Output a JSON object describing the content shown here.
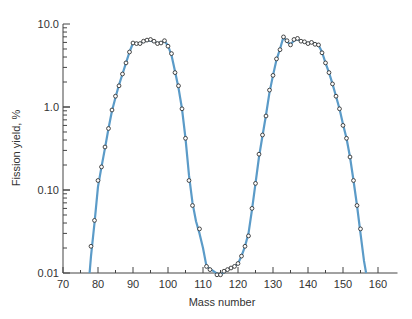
{
  "chart_data": {
    "type": "line",
    "title": "",
    "xlabel": "Mass number",
    "ylabel": "Fission yield, %",
    "xlim": [
      70,
      165
    ],
    "ylim": [
      0.01,
      10.0
    ],
    "yscale": "log",
    "grid": false,
    "legend": null,
    "x_ticks": [
      70,
      80,
      90,
      100,
      110,
      120,
      130,
      140,
      150,
      160
    ],
    "x_tick_labels": [
      "70",
      "80",
      "90",
      "100",
      "110",
      "120",
      "130",
      "140",
      "150",
      "160"
    ],
    "y_ticks": [
      0.01,
      0.1,
      1.0,
      10.0
    ],
    "y_tick_labels": [
      "0.01",
      "0.10",
      "1.0",
      "10.0"
    ],
    "line_color": "#5b9bc8",
    "marker_color": "#333333",
    "series": [
      {
        "name": "measured",
        "style": "open-circle-markers",
        "x": [
          78,
          79,
          80,
          81,
          82,
          83,
          84,
          85,
          86,
          87,
          88,
          89,
          90,
          91,
          92,
          93,
          94,
          95,
          96,
          97,
          98,
          99,
          100,
          101,
          102,
          103,
          104,
          105,
          106,
          107,
          109,
          111,
          112,
          114,
          115,
          116,
          117,
          118,
          119,
          120,
          121,
          122,
          123,
          124,
          125,
          126,
          127,
          128,
          129,
          130,
          131,
          132,
          133,
          134,
          135,
          136,
          137,
          138,
          139,
          140,
          141,
          142,
          143,
          144,
          145,
          146,
          147,
          148,
          149,
          150,
          151,
          152,
          153,
          154,
          155
        ],
        "y": [
          0.021,
          0.043,
          0.13,
          0.19,
          0.33,
          0.55,
          0.92,
          1.35,
          1.8,
          2.5,
          3.4,
          4.6,
          5.9,
          5.8,
          5.8,
          6.2,
          6.4,
          6.5,
          6.2,
          5.8,
          5.9,
          6.3,
          5.4,
          4.4,
          2.6,
          1.8,
          0.95,
          0.42,
          0.13,
          0.065,
          0.034,
          0.012,
          0.011,
          0.0095,
          0.0095,
          0.0105,
          0.011,
          0.0115,
          0.012,
          0.013,
          0.016,
          0.021,
          0.028,
          0.06,
          0.12,
          0.27,
          0.46,
          0.78,
          1.6,
          2.4,
          3.8,
          4.9,
          7.0,
          6.3,
          5.6,
          6.5,
          6.7,
          6.2,
          6.1,
          5.8,
          6.0,
          5.7,
          5.6,
          4.5,
          3.4,
          2.6,
          1.9,
          1.35,
          0.95,
          0.6,
          0.42,
          0.25,
          0.13,
          0.065,
          0.034
        ]
      }
    ],
    "curve": {
      "x": [
        77.6,
        78,
        79,
        80,
        81,
        82,
        83,
        84,
        85,
        86,
        87,
        88,
        89,
        90,
        91,
        92,
        93,
        94,
        95,
        96,
        97,
        98,
        99,
        100,
        101,
        102,
        103,
        104,
        105,
        106,
        107,
        108,
        109,
        110,
        111,
        112,
        113,
        114,
        115,
        116,
        117,
        118,
        119,
        120,
        121,
        122,
        123,
        124,
        125,
        126,
        127,
        128,
        129,
        130,
        131,
        132,
        133,
        134,
        135,
        136,
        137,
        138,
        139,
        140,
        141,
        142,
        143,
        144,
        145,
        146,
        147,
        148,
        149,
        150,
        151,
        152,
        153,
        154,
        155,
        156,
        156.6
      ],
      "y": [
        0.01,
        0.016,
        0.04,
        0.11,
        0.19,
        0.32,
        0.55,
        0.9,
        1.3,
        1.85,
        2.5,
        3.4,
        4.6,
        5.9,
        5.9,
        5.9,
        6.1,
        6.3,
        6.3,
        6.1,
        5.9,
        6.0,
        6.2,
        5.5,
        4.2,
        2.7,
        1.7,
        0.95,
        0.42,
        0.15,
        0.07,
        0.042,
        0.03,
        0.02,
        0.012,
        0.0112,
        0.0105,
        0.0098,
        0.0096,
        0.0102,
        0.011,
        0.0115,
        0.012,
        0.013,
        0.016,
        0.021,
        0.03,
        0.058,
        0.12,
        0.25,
        0.45,
        0.8,
        1.5,
        2.4,
        3.7,
        5.0,
        7.0,
        6.1,
        5.7,
        6.3,
        6.6,
        6.2,
        6.0,
        5.9,
        6.0,
        5.8,
        5.6,
        4.6,
        3.4,
        2.6,
        1.9,
        1.35,
        0.95,
        0.62,
        0.42,
        0.25,
        0.13,
        0.065,
        0.03,
        0.014,
        0.01
      ]
    }
  }
}
